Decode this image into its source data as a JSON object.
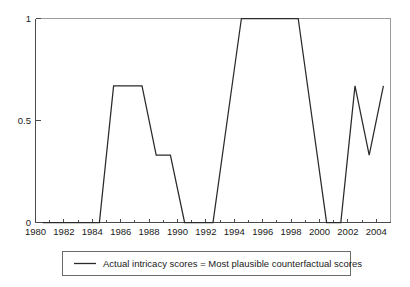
{
  "chart_data": {
    "type": "line",
    "title": "",
    "subtitle": "",
    "xlabel": "",
    "ylabel": "",
    "xlim": [
      1979.5,
      2004.5
    ],
    "ylim": [
      0,
      1
    ],
    "grid": false,
    "legend_position": "bottom",
    "x": [
      1980,
      1981,
      1982,
      1983,
      1984,
      1985,
      1986,
      1987,
      1988,
      1989,
      1990,
      1991,
      1992,
      1993,
      1994,
      1995,
      1996,
      1997,
      1998,
      1999,
      2000,
      2001,
      2002,
      2003,
      2004
    ],
    "series": [
      {
        "name": "Actual intricacy scores = Most plausible counterfactual scores",
        "values": [
          0,
          0,
          0,
          0,
          0,
          0.67,
          0.67,
          0.67,
          0.33,
          0.33,
          0,
          0,
          0,
          0.5,
          1,
          1,
          1,
          1,
          1,
          0.5,
          0,
          0,
          0.67,
          0.33,
          0.67
        ]
      }
    ],
    "x_tick_labels": [
      "1980",
      "1982",
      "1984",
      "1986",
      "1988",
      "1990",
      "1992",
      "1994",
      "1996",
      "1998",
      "2000",
      "2002",
      "2004"
    ],
    "x_tick_values": [
      1980,
      1982,
      1984,
      1986,
      1988,
      1990,
      1992,
      1994,
      1996,
      1998,
      2000,
      2002,
      2004
    ],
    "x_minor_tick_values": [
      1981,
      1983,
      1985,
      1987,
      1989,
      1991,
      1993,
      1995,
      1997,
      1999,
      2001,
      2003
    ],
    "y_tick_labels": [
      "0",
      "0.5",
      "1"
    ],
    "y_tick_values": [
      0,
      0.5,
      1
    ],
    "legend": {
      "entries": [
        {
          "label": "Actual intricacy scores = Most plausible counterfactual scores",
          "marker": "line",
          "color": "#2a2a2a"
        }
      ]
    },
    "colors": {
      "line": "#2a2a2a",
      "axis": "#4a4a4a",
      "text": "#1a1a1a",
      "background": "#ffffff",
      "legend_border": "#6a6a6a"
    }
  }
}
